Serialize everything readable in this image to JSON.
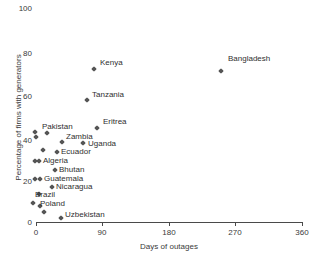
{
  "chart_data": {
    "type": "scatter",
    "title": "",
    "xlabel": "Days of outages",
    "ylabel": "Percentage of firms with generators",
    "xlim": [
      0,
      360
    ],
    "ylim": [
      0,
      100
    ],
    "xticks": [
      0,
      90,
      180,
      270,
      360
    ],
    "yticks": [
      0,
      20,
      40,
      60,
      80,
      100
    ],
    "xtick_labels": [
      "0",
      "90",
      "180",
      "270",
      "360"
    ],
    "ytick_labels": [
      "0",
      "20",
      "40",
      "60",
      "80",
      "100"
    ],
    "grid": false,
    "legend": "none",
    "points": [
      {
        "label": "Bangladesh",
        "x": 250,
        "y": 69,
        "label_pos": "right"
      },
      {
        "label": "Kenya",
        "x": 79,
        "y": 68,
        "label_pos": "right"
      },
      {
        "label": "Tanzania",
        "x": 69,
        "y": 53,
        "label_pos": "right"
      },
      {
        "label": "Eritrea",
        "x": 83,
        "y": 40,
        "label_pos": "right"
      },
      {
        "label": "Pakistan",
        "x": 5,
        "y": 38,
        "label_pos": "above"
      },
      {
        "label": "",
        "x": 5,
        "y": 36,
        "label_pos": "none"
      },
      {
        "label": "",
        "x": 11,
        "y": 38,
        "label_pos": "none"
      },
      {
        "label": "Zambia",
        "x": 35,
        "y": 34,
        "label_pos": "right"
      },
      {
        "label": "Uganda",
        "x": 63,
        "y": 34,
        "label_pos": "right"
      },
      {
        "label": "Ecuador",
        "x": 29,
        "y": 30,
        "label_pos": "right"
      },
      {
        "label": "",
        "x": 16,
        "y": 31,
        "label_pos": "none"
      },
      {
        "label": "Algeria",
        "x": 3,
        "y": 26,
        "label_pos": "right"
      },
      {
        "label": "",
        "x": 8,
        "y": 26,
        "label_pos": "none"
      },
      {
        "label": "Bhutan",
        "x": 26,
        "y": 22,
        "label_pos": "right"
      },
      {
        "label": "Guatemala",
        "x": 3,
        "y": 18,
        "label_pos": "right"
      },
      {
        "label": "",
        "x": 9,
        "y": 18,
        "label_pos": "none"
      },
      {
        "label": "Nicaragua",
        "x": 23,
        "y": 15,
        "label_pos": "right"
      },
      {
        "label": "Brazil",
        "x": 6,
        "y": 11,
        "label_pos": "above"
      },
      {
        "label": "Poland",
        "x": 6,
        "y": 7,
        "label_pos": "right"
      },
      {
        "label": "",
        "x": 1,
        "y": 9,
        "label_pos": "none"
      },
      {
        "label": "",
        "x": 13,
        "y": 4,
        "label_pos": "none"
      },
      {
        "label": "Uzbekistan",
        "x": 36,
        "y": 1,
        "label_pos": "right"
      }
    ]
  },
  "markers": [
    {
      "name": "bangladesh-point",
      "px": 221,
      "py": 71
    },
    {
      "name": "kenya-point",
      "px": 94,
      "py": 69
    },
    {
      "name": "tanzania-point",
      "px": 87,
      "py": 100
    },
    {
      "name": "eritrea-point",
      "px": 97,
      "py": 128
    },
    {
      "name": "pakistan-point-a",
      "px": 35,
      "py": 132
    },
    {
      "name": "pakistan-point-b",
      "px": 36,
      "py": 137
    },
    {
      "name": "pakistan-point-c",
      "px": 47,
      "py": 133
    },
    {
      "name": "zambia-point",
      "px": 62,
      "py": 142
    },
    {
      "name": "uganda-point",
      "px": 83,
      "py": 143
    },
    {
      "name": "ecuador-point",
      "px": 57,
      "py": 152
    },
    {
      "name": "cluster-point-a",
      "px": 43,
      "py": 150
    },
    {
      "name": "algeria-point-a",
      "px": 35,
      "py": 161
    },
    {
      "name": "algeria-point-b",
      "px": 39,
      "py": 161
    },
    {
      "name": "bhutan-point",
      "px": 55,
      "py": 170
    },
    {
      "name": "guatemala-point-a",
      "px": 35,
      "py": 179
    },
    {
      "name": "guatemala-point-b",
      "px": 40,
      "py": 179
    },
    {
      "name": "nicaragua-point",
      "px": 52,
      "py": 187
    },
    {
      "name": "brazil-point",
      "px": 39,
      "py": 194
    },
    {
      "name": "poland-point-a",
      "px": 33,
      "py": 203
    },
    {
      "name": "poland-point-b",
      "px": 40,
      "py": 206
    },
    {
      "name": "poland-point-c",
      "px": 44,
      "py": 212
    },
    {
      "name": "uzbekistan-point",
      "px": 61,
      "py": 218
    }
  ],
  "labels": [
    {
      "name": "label-bangladesh",
      "text": "Bangladesh",
      "px": 228,
      "py": 54
    },
    {
      "name": "label-kenya",
      "text": "Kenya",
      "px": 100,
      "py": 58
    },
    {
      "name": "label-tanzania",
      "text": "Tanzania",
      "px": 92,
      "py": 90
    },
    {
      "name": "label-eritrea",
      "text": "Eritrea",
      "px": 103,
      "py": 117
    },
    {
      "name": "label-pakistan",
      "text": "Pakistan",
      "px": 42,
      "py": 122
    },
    {
      "name": "label-zambia",
      "text": "Zambia",
      "px": 66,
      "py": 132
    },
    {
      "name": "label-uganda",
      "text": "Uganda",
      "px": 88,
      "py": 139
    },
    {
      "name": "label-ecuador",
      "text": "Ecuador",
      "px": 61,
      "py": 147
    },
    {
      "name": "label-algeria",
      "text": "Algeria",
      "px": 43,
      "py": 156
    },
    {
      "name": "label-bhutan",
      "text": "Bhutan",
      "px": 59,
      "py": 165
    },
    {
      "name": "label-guatemala",
      "text": "Guatemala",
      "px": 44,
      "py": 174
    },
    {
      "name": "label-nicaragua",
      "text": "Nicaragua",
      "px": 56,
      "py": 182
    },
    {
      "name": "label-brazil",
      "text": "Brazil",
      "px": 35,
      "py": 190
    },
    {
      "name": "label-poland",
      "text": "Poland",
      "px": 40,
      "py": 199
    },
    {
      "name": "label-uzbekistan",
      "text": "Uzbekistan",
      "px": 65,
      "py": 210
    }
  ],
  "axes": {
    "x_title": "Days of outages",
    "y_title": "Percentage of firms with generators",
    "x_ticks": [
      {
        "label": "0",
        "px": 36
      },
      {
        "label": "90",
        "px": 102
      },
      {
        "label": "180",
        "px": 169
      },
      {
        "label": "270",
        "px": 235
      },
      {
        "label": "360",
        "px": 302
      }
    ],
    "y_ticks": [
      {
        "label": "100",
        "py": 4
      },
      {
        "label": "80",
        "py": 49
      },
      {
        "label": "60",
        "py": 92
      },
      {
        "label": "40",
        "py": 136
      },
      {
        "label": "20",
        "py": 177
      },
      {
        "label": "0",
        "py": 218
      }
    ]
  },
  "colors": {
    "marker": "#555555",
    "axis": "#4a4a4a",
    "text": "#3a3a3a",
    "background": "#ffffff"
  }
}
